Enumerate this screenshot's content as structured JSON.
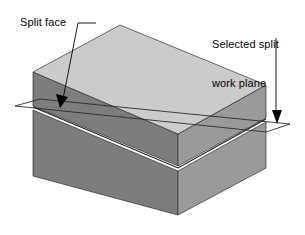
{
  "figure": {
    "type": "isometric-solid-diagram"
  },
  "annotations": {
    "split_face": {
      "label": "Split face",
      "lines": [
        "Split face"
      ],
      "leader": {
        "kind": "diagonal-with-stub",
        "stub_from": [
          96,
          23
        ],
        "stub_to": [
          78,
          23
        ],
        "line_to": [
          62,
          104
        ],
        "arrow_tip": [
          60,
          108
        ]
      }
    },
    "work_plane": {
      "label": "Selected split work plane",
      "lines": [
        "Selected split",
        "work plane"
      ],
      "leader": {
        "kind": "vertical",
        "line_from": [
          276,
          38
        ],
        "line_to": [
          276,
          116
        ],
        "arrow_tip": [
          277,
          124
        ]
      }
    }
  },
  "solid": {
    "name": "split-block",
    "top_face": {
      "name": "top-face",
      "points": "33,72 120,25 266,85 178,134",
      "color": "#cbcbcb"
    },
    "upper_left_face": {
      "name": "upper-left-face",
      "points": "33,72 178,134 178,166 33,106",
      "color": "#7d7d7d"
    },
    "upper_right_face": {
      "name": "upper-right-face",
      "points": "178,134 266,85 266,118 178,166",
      "color": "#9a9a9a"
    },
    "lower_left_face": {
      "name": "lower-left-face",
      "points": "33,110 178,171 178,215 33,176",
      "color": "#7d7d7d"
    },
    "lower_right_face": {
      "name": "lower-right-face",
      "points": "178,171 266,122 266,168 178,215",
      "color": "#9a9a9a"
    },
    "split_line": {
      "name": "split-line",
      "points": "33,107 178,168 266,119",
      "color": "#1a1a1a"
    }
  },
  "work_plane_outline": {
    "name": "work-plane-outline",
    "points": "15,106 40,99 290,124 266,132",
    "color": "#2b2b2b"
  },
  "colors": {
    "top_face": "#cbcbcb",
    "left_face": "#7d7d7d",
    "right_face": "#9a9a9a",
    "outline": "#1a1a1a",
    "text": "#000000",
    "background": "#ffffff"
  }
}
